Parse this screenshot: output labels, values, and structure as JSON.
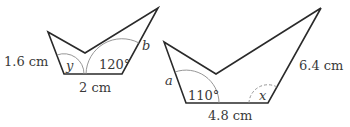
{
  "colors": {
    "outline": "#2a2a2a",
    "arc": "#8a8a8a",
    "text": "#3a3a3a"
  },
  "shapes": [
    {
      "id": "small",
      "vertices": [
        [
          48,
          32
        ],
        [
          85,
          53
        ],
        [
          158,
          8
        ],
        [
          122,
          74
        ],
        [
          64,
          74
        ]
      ],
      "labels": {
        "side_left": "1.6 cm",
        "base": "2 cm",
        "side_right": "b",
        "angle_left": "y",
        "angle_right": "120°"
      }
    },
    {
      "id": "large",
      "vertices": [
        [
          164,
          42
        ],
        [
          216,
          74
        ],
        [
          321,
          8
        ],
        [
          268,
          103
        ],
        [
          186,
          103
        ]
      ],
      "labels": {
        "side_left": "a",
        "base": "4.8 cm",
        "side_right": "6.4 cm",
        "angle_left": "110°",
        "angle_right": "x"
      }
    }
  ]
}
